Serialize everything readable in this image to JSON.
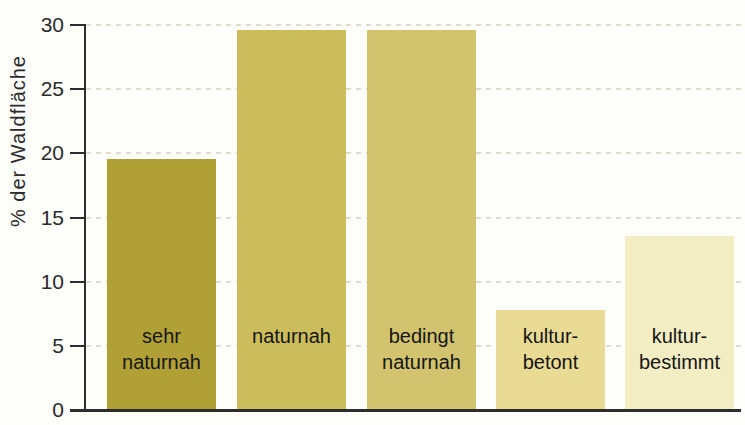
{
  "chart_data": {
    "type": "bar",
    "title": "",
    "xlabel": "",
    "ylabel": "% der Waldfläche",
    "ylim": [
      0,
      30
    ],
    "yticks": [
      0,
      5,
      10,
      15,
      20,
      25,
      30
    ],
    "grid": "dashed horizontal gridlines at each y tick",
    "legend": "none",
    "categories": [
      "sehr naturnah",
      "naturnah",
      "bedingt naturnah",
      "kultur-betont",
      "kultur-bestimmt"
    ],
    "values": [
      19.5,
      29.5,
      29.5,
      7.7,
      13.5
    ],
    "bar_label_lines": [
      [
        "sehr",
        "naturnah"
      ],
      [
        "naturnah"
      ],
      [
        "bedingt",
        "naturnah"
      ],
      [
        "kultur-",
        "betont"
      ],
      [
        "kultur-",
        "bestimmt"
      ]
    ],
    "bar_colors": [
      "#b0a035",
      "#ccbd5c",
      "#d2c46e",
      "#e9da94",
      "#f3edc4"
    ],
    "axis_color": "#2d2d2d",
    "gridline_color": "#ddd8c5",
    "background_color": "#fdfdfa"
  }
}
